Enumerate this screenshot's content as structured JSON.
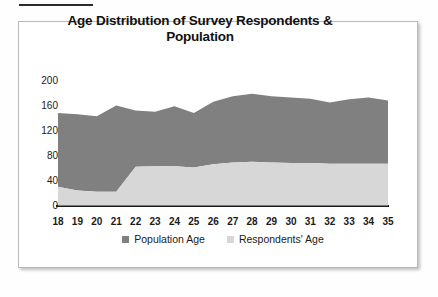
{
  "page": {
    "background_color": "#fefefe",
    "rule_color": "#2b2b2b"
  },
  "chart_frame": {
    "border_color": "#b9b9b9",
    "background_color": "#ffffff"
  },
  "legend": {
    "position": "bottom-center",
    "items": [
      {
        "label": "Population Age",
        "color": "#808080"
      },
      {
        "label": "Respondents' Age",
        "color": "#d7d7d7"
      }
    ]
  },
  "chart_data": {
    "type": "area",
    "stacked": true,
    "title": "Age Distribution of Survey Respondents & Population",
    "xlabel": "",
    "ylabel": "",
    "grid": false,
    "ylim": [
      0,
      200
    ],
    "ytick_labels": [
      "0",
      "40",
      "80",
      "120",
      "160",
      "200"
    ],
    "yticks": [
      0,
      40,
      80,
      120,
      160,
      200
    ],
    "categories": [
      18,
      19,
      20,
      21,
      22,
      23,
      24,
      25,
      26,
      27,
      28,
      29,
      30,
      31,
      32,
      33,
      34,
      35
    ],
    "xtick_labels": [
      "18",
      "19",
      "20",
      "21",
      "22",
      "23",
      "24",
      "25",
      "26",
      "27",
      "28",
      "29",
      "30",
      "31",
      "32",
      "33",
      "34",
      "35"
    ],
    "series": [
      {
        "name": "Respondents' Age",
        "color": "#d7d7d7",
        "values": [
          30,
          24,
          22,
          22,
          62,
          63,
          63,
          61,
          66,
          69,
          70,
          69,
          68,
          68,
          67,
          67,
          67,
          67
        ]
      },
      {
        "name": "Population Age",
        "color": "#808080",
        "comment": "plotted as the upper band; totals below are the stacked tops",
        "stacked_top_values": [
          148,
          146,
          143,
          160,
          152,
          150,
          159,
          148,
          166,
          175,
          179,
          175,
          173,
          171,
          165,
          170,
          173,
          168
        ],
        "values": [
          118,
          122,
          121,
          138,
          90,
          87,
          96,
          87,
          100,
          106,
          109,
          106,
          105,
          103,
          98,
          103,
          106,
          101
        ]
      }
    ]
  }
}
